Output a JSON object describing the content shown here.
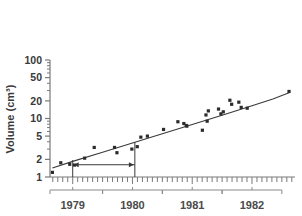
{
  "chart_data": {
    "type": "scatter",
    "title": "",
    "xlabel": "",
    "ylabel": "Volume (cm³)",
    "yscale": "log",
    "ylim": [
      1,
      100
    ],
    "yticks": [
      1,
      2,
      5,
      10,
      20,
      50,
      100
    ],
    "ytick_labels": [
      "1",
      "2",
      "5",
      "10",
      "20",
      "50",
      "100"
    ],
    "xlim": [
      1978.62,
      1982.72
    ],
    "xtick_labels": [
      "1979",
      "1980",
      "1981",
      "1982"
    ],
    "xtick_values": [
      1979.0,
      1980.0,
      1981.0,
      1982.0
    ],
    "x_minor_ticks": "monthly",
    "grid": false,
    "legend": null,
    "points": [
      {
        "x": 1978.66,
        "y": 1.2
      },
      {
        "x": 1978.8,
        "y": 1.75
      },
      {
        "x": 1978.95,
        "y": 1.65
      },
      {
        "x": 1979.03,
        "y": 1.6
      },
      {
        "x": 1979.2,
        "y": 2.1
      },
      {
        "x": 1979.36,
        "y": 3.2
      },
      {
        "x": 1979.7,
        "y": 3.2
      },
      {
        "x": 1979.74,
        "y": 2.6
      },
      {
        "x": 1979.99,
        "y": 3.0
      },
      {
        "x": 1980.08,
        "y": 3.3
      },
      {
        "x": 1980.14,
        "y": 4.8
      },
      {
        "x": 1980.25,
        "y": 5.0
      },
      {
        "x": 1980.52,
        "y": 6.5
      },
      {
        "x": 1980.76,
        "y": 8.8
      },
      {
        "x": 1980.86,
        "y": 8.2
      },
      {
        "x": 1980.9,
        "y": 7.6
      },
      {
        "x": 1980.91,
        "y": 7.4
      },
      {
        "x": 1981.17,
        "y": 6.3
      },
      {
        "x": 1981.23,
        "y": 11.5
      },
      {
        "x": 1981.25,
        "y": 9.0
      },
      {
        "x": 1981.27,
        "y": 13.5
      },
      {
        "x": 1981.44,
        "y": 14.5
      },
      {
        "x": 1981.48,
        "y": 12.0
      },
      {
        "x": 1981.52,
        "y": 13.0
      },
      {
        "x": 1981.63,
        "y": 20.5
      },
      {
        "x": 1981.66,
        "y": 17.5
      },
      {
        "x": 1981.78,
        "y": 19.0
      },
      {
        "x": 1981.82,
        "y": 15.5
      },
      {
        "x": 1981.92,
        "y": 15.0
      },
      {
        "x": 1982.62,
        "y": 29.0
      }
    ],
    "trend_line": [
      {
        "x": 1978.66,
        "y": 1.42
      },
      {
        "x": 1979.0,
        "y": 1.85
      },
      {
        "x": 1979.5,
        "y": 2.65
      },
      {
        "x": 1980.0,
        "y": 3.8
      },
      {
        "x": 1980.5,
        "y": 5.5
      },
      {
        "x": 1981.0,
        "y": 7.9
      },
      {
        "x": 1981.5,
        "y": 11.4
      },
      {
        "x": 1982.0,
        "y": 16.5
      },
      {
        "x": 1982.35,
        "y": 21.5
      },
      {
        "x": 1982.62,
        "y": 27.5
      }
    ],
    "annotation": {
      "kind": "doubling-interval",
      "left_x": 1979.0,
      "right_x": 1980.04,
      "y_level": 1.62,
      "left_top_y": 1.95,
      "right_top_y": 3.95,
      "arrow_double_headed": true
    }
  },
  "style": {
    "point_color": "#2b2b2b",
    "line_color": "#3a3a3a",
    "axis_color": "#7a7a7a",
    "text_color": "#3a3a3a",
    "bracket_color": "#8a8a8a",
    "background": "#ffffff"
  }
}
